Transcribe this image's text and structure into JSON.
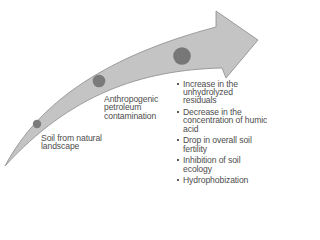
{
  "diagram": {
    "arrow": {
      "fill": "#c4c4c4",
      "stroke": "#8a8a8a"
    },
    "stages": [
      {
        "label_line1": "Soil from natural",
        "label_line2": "landscape",
        "marker_color": "#7b7b7b"
      },
      {
        "label_line1": "Anthropogenic",
        "label_line2": "petroleum",
        "label_line3": "contamination",
        "marker_color": "#7b7b7b"
      },
      {
        "marker_color": "#777777"
      }
    ],
    "effects": [
      "Increase in the unhydrolyzed residuals",
      "Decrease in the concentration of humic acid",
      "Drop in overall soil fertility",
      "Inhibition of soil ecology",
      "Hydrophobization"
    ]
  }
}
